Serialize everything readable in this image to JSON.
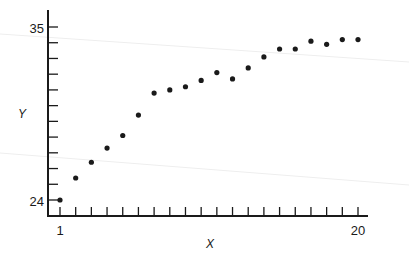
{
  "chart_data": {
    "type": "scatter",
    "title": "",
    "xlabel": "X",
    "ylabel": "Y",
    "xlim": [
      1,
      20
    ],
    "ylim": [
      24,
      35
    ],
    "x_tick_labels": [
      "1",
      "20"
    ],
    "y_tick_labels": [
      "24",
      "35"
    ],
    "x_ticks_count": 20,
    "y_ticks_count": 12,
    "grid": false,
    "legend": null,
    "x": [
      1,
      2,
      3,
      4,
      5,
      6,
      7,
      8,
      9,
      10,
      11,
      12,
      13,
      14,
      15,
      16,
      17,
      18,
      19,
      20
    ],
    "y": [
      24.0,
      25.4,
      26.4,
      27.3,
      28.1,
      29.4,
      30.8,
      31.0,
      31.2,
      31.6,
      32.1,
      31.7,
      32.4,
      33.1,
      33.6,
      33.6,
      34.1,
      33.9,
      34.2,
      34.2
    ]
  },
  "colors": {
    "ink": "#1a1a1a",
    "background": "#ffffff",
    "scan_artifact": "#ececec"
  }
}
